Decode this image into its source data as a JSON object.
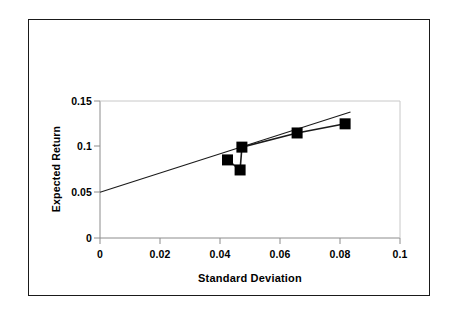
{
  "chart_data": {
    "type": "scatter",
    "title": "",
    "xlabel": "Standard Deviation",
    "ylabel": "Expected Return",
    "xlim": [
      0,
      0.1
    ],
    "ylim": [
      0,
      0.15
    ],
    "xticks": [
      "0",
      "0.02",
      "0.04",
      "0.06",
      "0.08",
      "0.1"
    ],
    "xtick_values": [
      0,
      0.02,
      0.04,
      0.06,
      0.08,
      0.1
    ],
    "yticks": [
      "0",
      "0.05",
      "0.1",
      "0.15"
    ],
    "ytick_values": [
      0,
      0.05,
      0.1,
      0.15
    ],
    "grid": false,
    "legend": "none",
    "marker_color": "#000000",
    "line_color": "#000000",
    "axis_color": "#808080",
    "series": [
      {
        "name": "Portfolio frontier",
        "style": "markers-with-connecting-line",
        "marker": "filled-square",
        "points": [
          {
            "x": 0.0425,
            "y": 0.0855
          },
          {
            "x": 0.0467,
            "y": 0.0745
          },
          {
            "x": 0.0473,
            "y": 0.0995
          },
          {
            "x": 0.0657,
            "y": 0.115
          },
          {
            "x": 0.0817,
            "y": 0.125
          }
        ],
        "connect_order": [
          0,
          1,
          2,
          3,
          4
        ]
      },
      {
        "name": "Capital market line",
        "style": "straight-line",
        "marker": "none",
        "points": [
          {
            "x": 0.0,
            "y": 0.05
          },
          {
            "x": 0.0835,
            "y": 0.138
          }
        ]
      }
    ]
  }
}
